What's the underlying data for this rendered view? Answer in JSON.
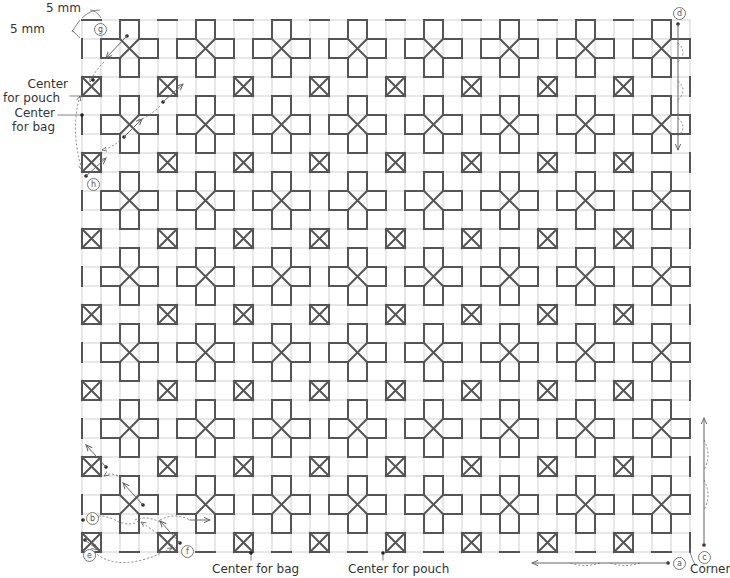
{
  "figure": {
    "type": "stitch-pattern-chart",
    "grid": {
      "origin_x": 82,
      "origin_y": 20,
      "cell_px": 19,
      "cols": 32,
      "rows": 28
    },
    "colors": {
      "grid_line": "#cfcfcf",
      "stitch_line": "#555555",
      "annotation": "#666666",
      "text": "#333333"
    },
    "motifs": {
      "cross": {
        "shape": "plus-with-x-center",
        "col_start": 2,
        "row_start": 1,
        "period": 4
      },
      "boxed_square": {
        "shape": "square-with-x",
        "col_start": 0,
        "row_start": 3,
        "period": 4
      }
    }
  },
  "labels": {
    "dim_horizontal": "5 mm",
    "dim_vertical": "5 mm",
    "center_pouch_left": "Center\nfor pouch",
    "center_bag_left": "Center\nfor bag",
    "center_bag_bottom": "Center for bag",
    "center_pouch_bottom": "Center for pouch",
    "corner": "Corner"
  },
  "markers": {
    "a": "a",
    "b": "b",
    "c": "c",
    "d": "d",
    "e": "e",
    "f": "f",
    "g": "g",
    "h": "h"
  }
}
